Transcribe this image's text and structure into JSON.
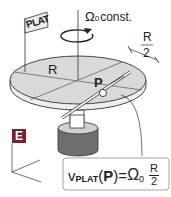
{
  "diagram": {
    "flag_label": "PLAT",
    "rotation": {
      "symbol": "Ω",
      "subscript": "0",
      "suffix": "const."
    },
    "radius_label": "R",
    "half_radius": {
      "numerator": "R",
      "denominator": "2"
    },
    "point_label": "P",
    "frame_label": "E",
    "formula": {
      "v": "v",
      "v_sub": "PLAT",
      "arg_open": "(",
      "arg": "P",
      "arg_close": ")",
      "equals": "=",
      "omega": "Ω",
      "omega_sub": "0",
      "frac_num": "R",
      "frac_den": "2"
    },
    "colors": {
      "disk_fill": "#d9d9d9",
      "line": "#333333",
      "base_fill": "#6e6e6e",
      "frame_box": "#7a1f2b",
      "formula_border": "#999999"
    }
  }
}
